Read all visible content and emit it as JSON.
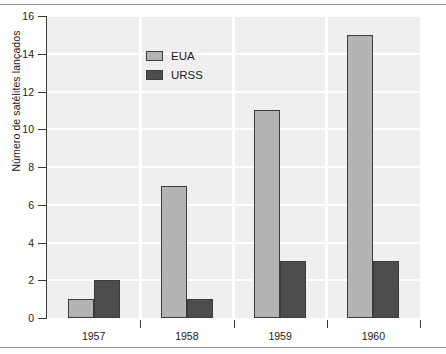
{
  "chart_data": {
    "type": "bar",
    "title": "",
    "xlabel": "",
    "ylabel": "Número de satélites lançados",
    "categories": [
      "1957",
      "1958",
      "1959",
      "1960"
    ],
    "series": [
      {
        "name": "EUA",
        "color": "#b4b4b4",
        "values": [
          1,
          7,
          11,
          15
        ]
      },
      {
        "name": "URSS",
        "color": "#4d4d4d",
        "values": [
          2,
          1,
          3,
          3
        ]
      }
    ],
    "ylim": [
      0,
      16
    ],
    "yticks": [
      "0",
      "2",
      "4",
      "6",
      "8",
      "10",
      "12",
      "14",
      "16"
    ],
    "ytick_values": [
      0,
      2,
      4,
      6,
      8,
      10,
      12,
      14,
      16
    ],
    "grid": "horizontal-and-vertical",
    "grid_color": "#ffffff",
    "plot_background": "#efefef",
    "legend_position": "top-center-left",
    "legend": [
      "EUA",
      "URSS"
    ]
  }
}
